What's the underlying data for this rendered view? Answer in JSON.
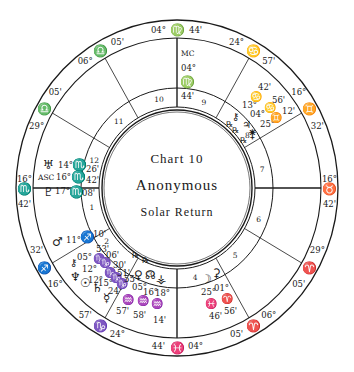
{
  "chart": {
    "title_line1": "Chart 10",
    "title_line2": "Anonymous",
    "title_line3": "Solar Return"
  },
  "houses": [
    {
      "num": "1",
      "angle": 192
    },
    {
      "num": "2",
      "angle": 216
    },
    {
      "num": "3",
      "angle": 252
    },
    {
      "num": "4",
      "angle": 282
    },
    {
      "num": "5",
      "angle": 312
    },
    {
      "num": "6",
      "angle": 340
    },
    {
      "num": "7",
      "angle": 12
    },
    {
      "num": "8",
      "angle": 36
    },
    {
      "num": "9",
      "angle": 72
    },
    {
      "num": "10",
      "angle": 102
    },
    {
      "num": "11",
      "angle": 132
    },
    {
      "num": "12",
      "angle": 162
    }
  ],
  "cusps": [
    {
      "house": "1",
      "label": "ASC",
      "sign": "♏",
      "deg": "16°",
      "min": "42'",
      "angle": 180
    },
    {
      "house": "2",
      "sign": "♐",
      "deg": "16°",
      "min": "32'",
      "angle": 210
    },
    {
      "house": "3",
      "sign": "♑",
      "deg": "24°",
      "min": "57'",
      "angle": 240
    },
    {
      "house": "4",
      "sign": "♓",
      "deg": "04°",
      "min": "44'",
      "angle": 270
    },
    {
      "house": "5",
      "sign": "♈",
      "deg": "06°",
      "min": "05'",
      "angle": 300
    },
    {
      "house": "6",
      "sign": "♈",
      "deg": "29°",
      "min": "05'",
      "angle": 330
    },
    {
      "house": "7",
      "sign": "♉",
      "deg": "16°",
      "min": "42'",
      "angle": 0
    },
    {
      "house": "8",
      "sign": "♊",
      "deg": "16°",
      "min": "32'",
      "angle": 30
    },
    {
      "house": "9",
      "sign": "♋",
      "deg": "24°",
      "min": "57'",
      "angle": 60
    },
    {
      "house": "10",
      "label": "MC",
      "sign": "♍",
      "deg": "04°",
      "min": "44'",
      "angle": 90
    },
    {
      "house": "11",
      "sign": "♎",
      "deg": "06°",
      "min": "05'",
      "angle": 120
    },
    {
      "house": "12",
      "sign": "♎",
      "deg": "29°",
      "min": "05'",
      "angle": 150
    }
  ],
  "mc_label": {
    "label": "MC",
    "deg": "04°",
    "sign": "♍",
    "min": "44'"
  },
  "planets": [
    {
      "name": "Uranus",
      "glyph": "♅",
      "deg": "14°",
      "sign": "♏",
      "min": "26'",
      "house": "12"
    },
    {
      "name": "Ascendant",
      "glyph": "ASC",
      "deg": "16°",
      "sign": "♏",
      "min": "42'",
      "house": "1"
    },
    {
      "name": "Pluto",
      "glyph": "♇",
      "deg": "17°",
      "sign": "♏",
      "min": "08'",
      "house": "1"
    },
    {
      "name": "Mars",
      "glyph": "♂",
      "deg": "11°",
      "sign": "♐",
      "min": "10'",
      "house": "1"
    },
    {
      "name": "Chiron",
      "glyph": "⚷",
      "deg": "05°",
      "sign": "♑",
      "min": "53'",
      "house": "2"
    },
    {
      "name": "Neptune",
      "glyph": "♆",
      "deg": "12°",
      "sign": "♑",
      "min": "06'",
      "house": "2"
    },
    {
      "name": "Sun",
      "glyph": "☉",
      "deg": "12°",
      "sign": "♑",
      "min": "30'",
      "house": "2"
    },
    {
      "name": "Saturn",
      "glyph": "♄",
      "deg": "15°",
      "sign": "♑",
      "min": "51'",
      "house": "2"
    },
    {
      "name": "Mercury",
      "glyph": "☿",
      "deg": "24°",
      "sign": "♑",
      "min": "55'",
      "house": "2"
    },
    {
      "name": "Venus",
      "glyph": "♀",
      "deg": "05°",
      "sign": "♒",
      "min": "57'",
      "house": "3",
      "retro": "℞"
    },
    {
      "name": "North Node",
      "glyph": "☊",
      "deg": "16°",
      "sign": "♒",
      "min": "58'",
      "house": "3",
      "retro": "℞"
    },
    {
      "name": "Vesta",
      "glyph": "⚶",
      "deg": "18°",
      "sign": "♒",
      "min": "14'",
      "house": "3"
    },
    {
      "name": "Moon",
      "glyph": "☽",
      "deg": "25°",
      "sign": "♓",
      "min": "46'",
      "house": "4"
    },
    {
      "name": "Ceres",
      "glyph": "⚳",
      "deg": "01°",
      "sign": "♈",
      "min": "56'",
      "house": "4"
    },
    {
      "name": "Chiron2",
      "glyph": "⚷",
      "deg": "13°",
      "sign": "♋",
      "min": "42'",
      "house": "8",
      "retro": "℞"
    },
    {
      "name": "Jupiter",
      "glyph": "♃",
      "deg": "04°",
      "sign": "♋",
      "min": "56'",
      "house": "8",
      "retro": "℞"
    },
    {
      "name": "Juno",
      "glyph": "⚵",
      "deg": "25°",
      "sign": "♊",
      "min": "12'",
      "house": "8",
      "retro": "℞"
    }
  ]
}
